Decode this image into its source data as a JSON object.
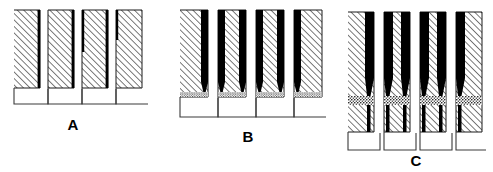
{
  "figure": {
    "background_color": "#ffffff",
    "line_color": "#1a1a1a",
    "deposit_color": "#000000",
    "hatch_color": "#1a1a1a",
    "stipple_color": "#000000",
    "panel_count": 3
  },
  "panels": [
    {
      "id": "A",
      "label": "A",
      "label_x": 73,
      "label_y": 130,
      "stage": "thin-conformal-liner",
      "origin_x": 14,
      "top_y": 10,
      "substrate_bottom_y": 88,
      "trench_bottom_y": 104,
      "wall_count": 4,
      "trench_count": 4,
      "wall_width": 26,
      "trench_width": 8,
      "pitch": 34,
      "deposit_thickness": 2.4,
      "taper_y": 0,
      "has_stipple_band": false,
      "stipple_at_trench_floor": false,
      "description": "Thin dark liner on one sidewall of each narrow trench; open U-shaped trench floors below the hatched substrate."
    },
    {
      "id": "B",
      "label": "B",
      "label_x": 248,
      "label_y": 142,
      "stage": "thick-deposit-tapering",
      "origin_x": 180,
      "top_y": 10,
      "substrate_bottom_y": 97,
      "trench_bottom_y": 117,
      "wall_count": 4,
      "trench_count": 4,
      "wall_width": 28,
      "trench_width": 10,
      "pitch": 38,
      "deposit_thickness": 7.5,
      "taper_y": 82,
      "has_stipple_band": false,
      "stipple_at_trench_floor": true,
      "description": "Thick dark deposit on both sidewalls of each trench, tapering to a point near the trench floor; fine stipple along the substrate bottom edge."
    },
    {
      "id": "C",
      "label": "C",
      "label_x": 416,
      "label_y": 166,
      "stage": "near-closure-void-seam",
      "origin_x": 348,
      "top_y": 12,
      "stipple_band_y": 96,
      "stipple_band_height": 9,
      "substrate_bottom_y": 132,
      "trench_bottom_y": 150,
      "wall_count": 4,
      "trench_count": 4,
      "wall_width": 26,
      "trench_width": 10,
      "pitch": 36,
      "deposit_thickness": 9.5,
      "taper_y": 78,
      "has_stipple_band": true,
      "stipple_at_trench_floor": false,
      "description": "Deposit nearly closes each trench leaving a narrow seam; a granular stippled horizontal band crosses the structure above the hatched lower substrate and U-shaped floors."
    }
  ],
  "legend": {
    "hatch_meaning": "substrate material",
    "solid_black_meaning": "deposited film",
    "stipple_meaning": "granular / void interface layer",
    "white_meaning": "open trench / seam"
  }
}
